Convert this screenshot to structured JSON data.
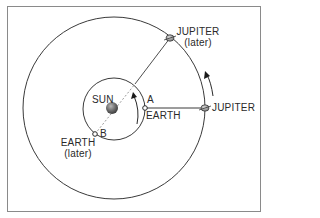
{
  "diagram": {
    "labels": {
      "sun": "SUN",
      "jupiter": "JUPITER",
      "jupiter_later": "JUPITER",
      "jupiter_later_sub": "(later)",
      "earth": "EARTH",
      "earth_later": "EARTH",
      "earth_later_sub": "(later)",
      "point_a": "A",
      "point_b": "B"
    },
    "colors": {
      "line": "#3a3a3a",
      "frame": "#8a8a8a",
      "sun": "#6a6a6a",
      "planet": "#9a9a9a",
      "dashed": "#9a9a9a"
    },
    "orbits": [
      {
        "name": "earth-orbit",
        "cx": 114,
        "cy": 109,
        "r": 31
      },
      {
        "name": "jupiter-orbit",
        "cx": 114,
        "cy": 108,
        "r": 91
      }
    ],
    "positions": {
      "sun": [
        112,
        108
      ],
      "earth_a": [
        145,
        108
      ],
      "earth_b": [
        95,
        134
      ],
      "jupiter": [
        205,
        108
      ],
      "jupiter_later": [
        170,
        38
      ]
    }
  }
}
